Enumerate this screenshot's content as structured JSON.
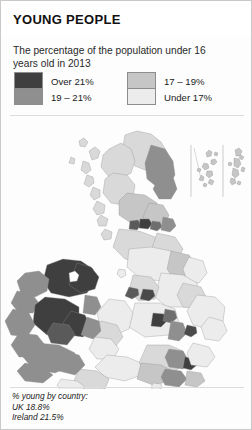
{
  "header": {
    "title": "YOUNG PEOPLE"
  },
  "subtitle": "The percentage of the population under 16 years old in 2013",
  "legend": {
    "left": [
      {
        "label": "Over 21%",
        "color": "#3f3f3f"
      },
      {
        "label": "19 – 21%",
        "color": "#8f8f8f"
      }
    ],
    "right": [
      {
        "label": "17 – 19%",
        "color": "#c6c6c6"
      },
      {
        "label": "Under 17%",
        "color": "#ececec"
      }
    ]
  },
  "footer": {
    "heading": "% young by country:",
    "uk": "UK 18.8%",
    "ireland": "Ireland 21.5%"
  },
  "map": {
    "title": "Map of the United Kingdom and Ireland shaded by percentage of population under 16",
    "insets": [
      "orkney-inset",
      "shetland-inset"
    ],
    "colors": {
      "over21": "#3f3f3f",
      "pct19to21": "#8f8f8f",
      "pct17to19": "#c6c6c6",
      "under17": "#ececec",
      "border": "#8e8e8e",
      "background": "#fdfdfd"
    }
  }
}
